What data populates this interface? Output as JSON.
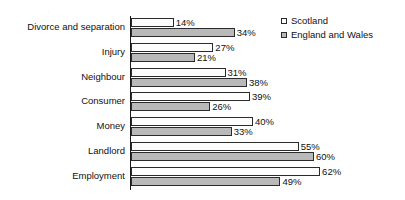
{
  "chart_data": {
    "type": "bar",
    "orientation": "horizontal",
    "grouped": true,
    "title": "",
    "subtitle": "",
    "xlabel": "",
    "ylabel": "",
    "xlim": [
      0,
      65
    ],
    "grid": false,
    "value_suffix": "%",
    "legend_position": "top-right",
    "categories": [
      "Divorce and separation",
      "Injury",
      "Neighbour",
      "Consumer",
      "Money",
      "Landlord",
      "Employment"
    ],
    "series": [
      {
        "name": "Scotland",
        "color": "#fdfdfd",
        "border": "#2b2b2b",
        "values": [
          14,
          27,
          31,
          39,
          40,
          55,
          62
        ],
        "labels": [
          "14%",
          "27%",
          "31%",
          "39%",
          "40%",
          "55%",
          "62%"
        ]
      },
      {
        "name": "England and Wales",
        "color": "#b9b9b9",
        "border": "#2b2b2b",
        "values": [
          34,
          21,
          38,
          26,
          33,
          60,
          49
        ],
        "labels": [
          "34%",
          "21%",
          "38%",
          "26%",
          "33%",
          "60%",
          "49%"
        ]
      }
    ]
  },
  "legend": {
    "items": [
      {
        "label": "Scotland",
        "swatch": "s-scotland"
      },
      {
        "label": "England and Wales",
        "swatch": "s-england"
      }
    ]
  }
}
